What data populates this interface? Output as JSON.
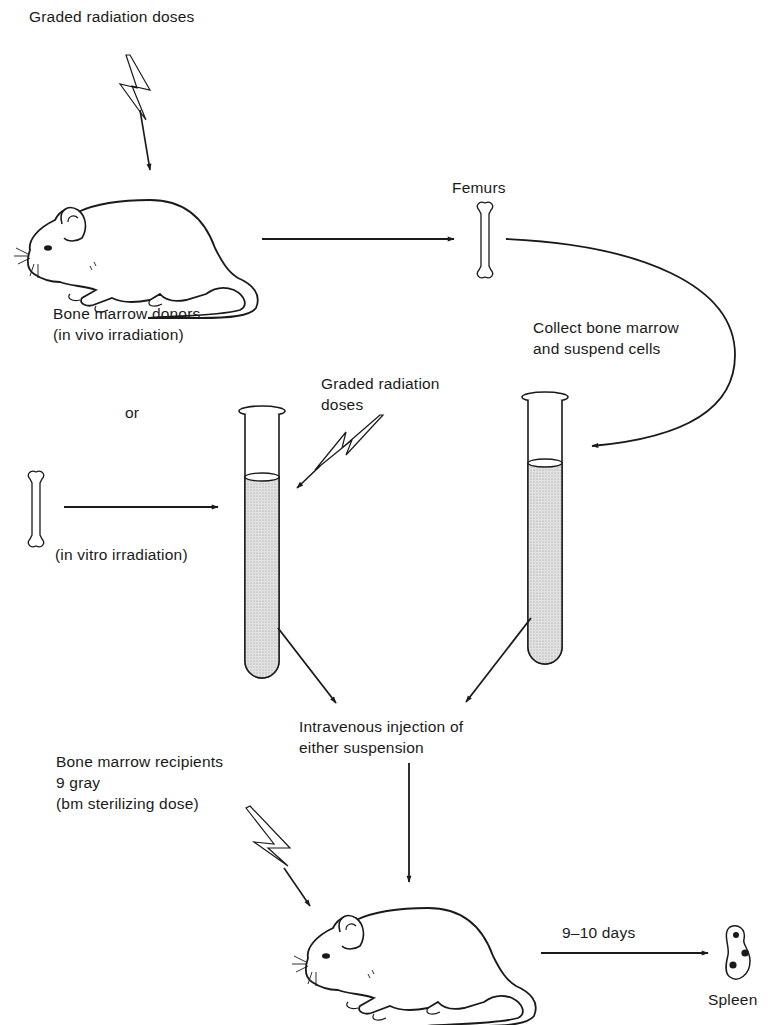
{
  "diagram": {
    "type": "flowchart",
    "colors": {
      "ink": "#1a1a1a",
      "fluid": "#d6d6d6",
      "background": "#ffffff"
    },
    "labels": {
      "donor_radiation": "Graded radiation doses",
      "femurs": "Femurs",
      "donors_line1": "Bone marrow donors",
      "donors_line2": "(in vivo irradiation)",
      "collect_line1": "Collect bone marrow",
      "collect_line2": "and suspend cells",
      "tube_radiation_line1": "Graded radiation",
      "tube_radiation_line2": "doses",
      "or": "or",
      "in_vitro": "(in vitro irradiation)",
      "injection_line1": "Intravenous injection of",
      "injection_line2": "either suspension",
      "recipients_line1": "Bone marrow recipients",
      "recipients_line2": "9 gray",
      "recipients_line3": "(bm sterilizing dose)",
      "duration": "9–10 days",
      "spleen": "Spleen"
    },
    "nodes": [
      {
        "id": "donor-mouse",
        "icon": "mouse-icon"
      },
      {
        "id": "femur-top",
        "icon": "bone-icon"
      },
      {
        "id": "femur-left",
        "icon": "bone-icon"
      },
      {
        "id": "tube-left",
        "icon": "test-tube-icon"
      },
      {
        "id": "tube-right",
        "icon": "test-tube-icon"
      },
      {
        "id": "recipient-mouse",
        "icon": "mouse-icon"
      },
      {
        "id": "spleen",
        "icon": "spleen-icon"
      }
    ],
    "edges": [
      {
        "from": "donor-mouse",
        "to": "femur-top"
      },
      {
        "from": "femur-top",
        "to": "tube-right",
        "label": "Collect bone marrow and suspend cells"
      },
      {
        "from": "femur-left",
        "to": "tube-left",
        "label": "(in vitro irradiation)"
      },
      {
        "from": "tube-left",
        "to": "injection"
      },
      {
        "from": "tube-right",
        "to": "injection"
      },
      {
        "from": "injection",
        "to": "recipient-mouse"
      },
      {
        "from": "recipient-mouse",
        "to": "spleen",
        "label": "9–10 days"
      }
    ]
  }
}
